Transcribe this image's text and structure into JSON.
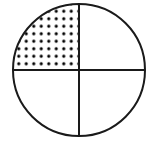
{
  "figure": {
    "name": "circle-divided-into-quadrants-with-one-shaded",
    "canvas": {
      "width": 157,
      "height": 142,
      "background": "#ffffff"
    },
    "stroke_color": "#1a1a1a",
    "fill_color": "#ffffff",
    "dot_color": "#000000",
    "circle": {
      "center_x": 79,
      "center_y": 70,
      "radius": 66,
      "stroke_width": 2
    },
    "diameters": [
      {
        "label": "vertical-diameter",
        "x1": 79,
        "y1": 4,
        "x2": 79,
        "y2": 136,
        "stroke_width": 2
      },
      {
        "label": "horizontal-diameter",
        "x1": 13,
        "y1": 70,
        "x2": 145,
        "y2": 70,
        "stroke_width": 2
      }
    ],
    "quadrants": [
      {
        "label": "upper-left",
        "shaded": true,
        "pattern": "dots",
        "fraction": "1/4"
      },
      {
        "label": "upper-right",
        "shaded": false,
        "pattern": "none",
        "fraction": "1/4"
      },
      {
        "label": "lower-left",
        "shaded": false,
        "pattern": "none",
        "fraction": "1/4"
      },
      {
        "label": "lower-right",
        "shaded": false,
        "pattern": "none",
        "fraction": "1/4"
      }
    ],
    "dot_pattern": {
      "spacing": 7.5,
      "dot_radius": 1.6,
      "rows": 9,
      "columns": 9
    }
  }
}
